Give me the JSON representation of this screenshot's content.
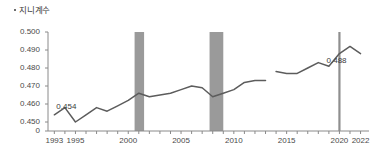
{
  "chart_data": {
    "type": "line",
    "title": "지니계수",
    "xlabel": "",
    "ylabel": "",
    "ylim": [
      0.445,
      0.5
    ],
    "xlim": [
      1993,
      2022
    ],
    "grid": false,
    "legend": "none",
    "y_ticks": [
      "0.500",
      "0.490",
      "0.480",
      "0.470",
      "0.460",
      "0.450",
      "0"
    ],
    "y_tick_values": [
      0.5,
      0.49,
      0.48,
      0.47,
      0.46,
      0.45,
      0.445
    ],
    "x_ticks": [
      "1993",
      "1995",
      "2000",
      "2005",
      "2010",
      "2015",
      "2020",
      "2022"
    ],
    "x_tick_values": [
      1993,
      1995,
      2000,
      2005,
      2010,
      2015,
      2020,
      2022
    ],
    "series": [
      {
        "name": "지니계수 (구 기준)",
        "x": [
          1993,
          1994,
          1995,
          1996,
          1997,
          1998,
          1999,
          2000,
          2001,
          2002,
          2003,
          2004,
          2005,
          2006,
          2007,
          2008,
          2009,
          2010,
          2011,
          2012,
          2013
        ],
        "values": [
          0.454,
          0.458,
          0.45,
          0.454,
          0.458,
          0.456,
          0.459,
          0.462,
          0.466,
          0.464,
          0.465,
          0.466,
          0.468,
          0.47,
          0.469,
          0.464,
          0.466,
          0.468,
          0.472,
          0.473,
          0.473
        ],
        "color": "#5c5c5c"
      },
      {
        "name": "지니계수 (신 기준)",
        "x": [
          2014,
          2015,
          2016,
          2017,
          2018,
          2019,
          2020,
          2021,
          2022
        ],
        "values": [
          0.478,
          0.477,
          0.477,
          0.48,
          0.483,
          0.481,
          0.488,
          0.492,
          0.488
        ],
        "color": "#5c5c5c"
      }
    ],
    "annotations": [
      {
        "name": "start-value-label",
        "text": "0.454",
        "x": 1993,
        "y": 0.454
      },
      {
        "name": "end-value-label",
        "text": "0.488",
        "x": 2022,
        "y": 0.488
      }
    ],
    "shaded_bands": [
      {
        "name": "recession-band-2001",
        "start": 2000.6,
        "end": 2001.5,
        "color": "#9a9a9a"
      },
      {
        "name": "recession-band-2008",
        "start": 2007.7,
        "end": 2009.0,
        "color": "#9a9a9a"
      }
    ],
    "marker_lines": [
      {
        "name": "marker-line-2020",
        "x": 2020,
        "color": "#8f8f8f"
      }
    ],
    "axis_color": "#8a8a8a",
    "line_color": "#5c5c5c"
  }
}
